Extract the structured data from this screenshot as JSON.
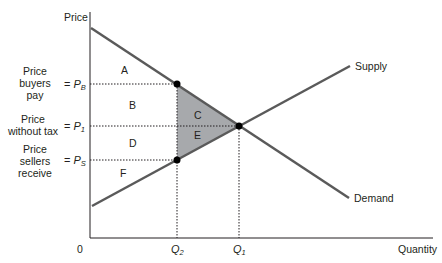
{
  "diagram": {
    "axes": {
      "y_label": "Price",
      "x_label": "Quantity",
      "origin_label": "0"
    },
    "curves": {
      "supply_label": "Supply",
      "demand_label": "Demand"
    },
    "price_levels": [
      {
        "desc_lines": [
          "Price",
          "buyers",
          "pay"
        ],
        "symbol": "P",
        "subscript": "B",
        "prefix": "="
      },
      {
        "desc_lines": [
          "Price",
          "without tax"
        ],
        "symbol": "P",
        "subscript": "1",
        "prefix": "="
      },
      {
        "desc_lines": [
          "Price",
          "sellers",
          "receive"
        ],
        "symbol": "P",
        "subscript": "S",
        "prefix": "="
      }
    ],
    "quantities": [
      {
        "symbol": "Q",
        "subscript": "2"
      },
      {
        "symbol": "Q",
        "subscript": "1"
      }
    ],
    "regions": [
      "A",
      "B",
      "C",
      "D",
      "E",
      "F"
    ],
    "colors": {
      "curve": "#5a5a5a",
      "axis": "#231f20",
      "shaded_triangle": "#a7a9ac",
      "dot": "#000000"
    }
  }
}
